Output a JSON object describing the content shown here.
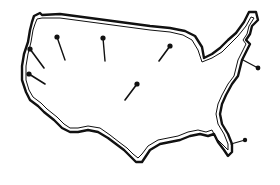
{
  "illustration": {
    "subject": "United States outline map with pushpins",
    "colors": {
      "background": "#ffffff",
      "ink": "#111111"
    },
    "pins": [
      {
        "id": 1,
        "head": [
          30,
          49
        ],
        "tip": [
          44,
          68
        ]
      },
      {
        "id": 2,
        "head": [
          29,
          74
        ],
        "tip": [
          45,
          84
        ]
      },
      {
        "id": 3,
        "head": [
          57,
          37
        ],
        "tip": [
          65,
          60
        ]
      },
      {
        "id": 4,
        "head": [
          103,
          38
        ],
        "tip": [
          105,
          61
        ]
      },
      {
        "id": 5,
        "head": [
          170,
          46
        ],
        "tip": [
          159,
          61
        ]
      },
      {
        "id": 6,
        "head": [
          137,
          84
        ],
        "tip": [
          125,
          100
        ]
      },
      {
        "id": 7,
        "head": [
          258,
          68
        ],
        "tip": [
          243,
          60
        ]
      },
      {
        "id": 8,
        "head": [
          245,
          140
        ],
        "tip": [
          231,
          144
        ]
      }
    ]
  }
}
